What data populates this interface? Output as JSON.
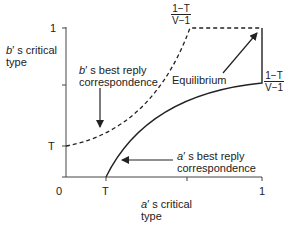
{
  "diagram": {
    "y_axis": {
      "label_prefix": "b",
      "label_rest": "′ s critical",
      "label_line2": "type",
      "ticks": {
        "top": "1",
        "T": "T"
      }
    },
    "x_axis": {
      "label_prefix": "a",
      "label_rest": "′ s critical",
      "label_line2": "type",
      "ticks": {
        "origin": "0",
        "T": "T",
        "right": "1"
      }
    },
    "annotations": {
      "b_best_reply": {
        "prefix": "b",
        "line1_rest": "′ s best reply",
        "line2": "correspondence"
      },
      "a_best_reply": {
        "prefix": "a",
        "line1_rest": "′ s best reply",
        "line2": "correspondence"
      },
      "equilibrium": "Equilibrium",
      "top_fraction": {
        "numerator": "1−T",
        "denominator": "V−1"
      },
      "right_fraction": {
        "numerator": "1−T",
        "denominator": "V−1"
      }
    },
    "curves": {
      "b_best_reply_style": "dashed",
      "a_best_reply_style": "solid"
    },
    "colors": {
      "line": "#222222",
      "background": "#ffffff"
    }
  }
}
